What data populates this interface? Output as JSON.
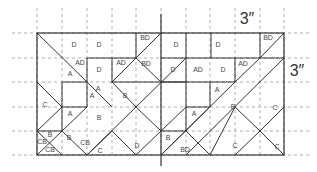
{
  "diagram": {
    "grid_unit_label": "3″",
    "dimension_labels": [
      {
        "text": "3″",
        "x": 247,
        "y": 20
      },
      {
        "text": "3″",
        "x": 297,
        "y": 72
      }
    ],
    "grid": {
      "cols_x": [
        37,
        62,
        87,
        112,
        136,
        161,
        186,
        210,
        235,
        260,
        284
      ],
      "rows_y": [
        33,
        58,
        82,
        107,
        131,
        155
      ],
      "extend_top": 8,
      "extend_left": 12,
      "extend_right": 312
    },
    "outer_rect": {
      "x": 37,
      "y": 33,
      "w": 247,
      "h": 122
    },
    "center_divider": {
      "x": 161,
      "y1": 14,
      "y2": 166
    },
    "lines": [
      [
        37,
        33,
        87,
        82
      ],
      [
        87,
        58,
        87,
        107
      ],
      [
        87,
        58,
        136,
        58
      ],
      [
        136,
        33,
        136,
        58
      ],
      [
        112,
        58,
        112,
        82
      ],
      [
        87,
        82,
        112,
        107
      ],
      [
        112,
        82,
        186,
        82
      ],
      [
        136,
        58,
        111,
        83
      ],
      [
        136,
        58,
        161,
        33
      ],
      [
        186,
        33,
        186,
        58
      ],
      [
        161,
        58,
        284,
        58
      ],
      [
        211,
        33,
        211,
        58
      ],
      [
        260,
        33,
        260,
        58
      ],
      [
        260,
        58,
        284,
        33
      ],
      [
        186,
        58,
        186,
        131
      ],
      [
        235,
        58,
        235,
        82
      ],
      [
        235,
        82,
        260,
        58
      ],
      [
        161,
        82,
        235,
        82
      ],
      [
        210,
        82,
        210,
        107
      ],
      [
        186,
        107,
        210,
        107
      ],
      [
        210,
        107,
        161,
        155
      ],
      [
        235,
        82,
        161,
        155
      ],
      [
        284,
        58,
        186,
        155
      ],
      [
        186,
        131,
        161,
        131
      ],
      [
        186,
        131,
        210,
        155
      ],
      [
        284,
        107,
        260,
        131
      ],
      [
        260,
        131,
        235,
        155
      ],
      [
        235,
        107,
        260,
        131
      ],
      [
        210,
        155,
        235,
        107
      ],
      [
        260,
        131,
        284,
        155
      ],
      [
        37,
        82,
        62,
        107
      ],
      [
        62,
        82,
        62,
        131
      ],
      [
        62,
        107,
        37,
        131
      ],
      [
        62,
        82,
        87,
        82
      ],
      [
        37,
        131,
        62,
        131
      ],
      [
        37,
        131,
        62,
        155
      ],
      [
        37,
        155,
        62,
        131
      ],
      [
        62,
        107,
        87,
        107
      ],
      [
        87,
        107,
        62,
        131
      ],
      [
        62,
        131,
        87,
        155
      ],
      [
        87,
        155,
        136,
        107
      ],
      [
        136,
        107,
        112,
        82
      ],
      [
        87,
        155,
        112,
        131
      ],
      [
        112,
        131,
        136,
        155
      ],
      [
        136,
        155,
        161,
        131
      ],
      [
        136,
        107,
        186,
        58
      ],
      [
        136,
        107,
        161,
        131
      ],
      [
        161,
        131,
        186,
        107
      ],
      [
        161,
        82,
        136,
        58
      ]
    ],
    "pieces": [
      {
        "label": "D",
        "x": 74,
        "y": 45
      },
      {
        "label": "D",
        "x": 99,
        "y": 45
      },
      {
        "label": "BD",
        "x": 145,
        "y": 38
      },
      {
        "label": "AD",
        "x": 80,
        "y": 63
      },
      {
        "label": "A",
        "x": 70,
        "y": 74
      },
      {
        "label": "D",
        "x": 99,
        "y": 70
      },
      {
        "label": "AD",
        "x": 121,
        "y": 63
      },
      {
        "label": "BD",
        "x": 146,
        "y": 64
      },
      {
        "label": "A",
        "x": 98,
        "y": 89
      },
      {
        "label": "A",
        "x": 92,
        "y": 96
      },
      {
        "label": "B",
        "x": 125,
        "y": 96
      },
      {
        "label": "C",
        "x": 45,
        "y": 105
      },
      {
        "label": "A",
        "x": 70,
        "y": 114
      },
      {
        "label": "B",
        "x": 99,
        "y": 118
      },
      {
        "label": "B",
        "x": 50,
        "y": 135
      },
      {
        "label": "CB",
        "x": 42,
        "y": 142
      },
      {
        "label": "CB",
        "x": 50,
        "y": 150
      },
      {
        "label": "B",
        "x": 69,
        "y": 138
      },
      {
        "label": "CB",
        "x": 85,
        "y": 143
      },
      {
        "label": "C",
        "x": 100,
        "y": 151
      },
      {
        "label": "D",
        "x": 137,
        "y": 146
      },
      {
        "label": "D",
        "x": 176,
        "y": 45
      },
      {
        "label": "D",
        "x": 218,
        "y": 45
      },
      {
        "label": "BD",
        "x": 268,
        "y": 38
      },
      {
        "label": "D",
        "x": 173,
        "y": 70
      },
      {
        "label": "AD",
        "x": 198,
        "y": 70
      },
      {
        "label": "D",
        "x": 223,
        "y": 70
      },
      {
        "label": "AD",
        "x": 243,
        "y": 64
      },
      {
        "label": "A",
        "x": 217,
        "y": 90
      },
      {
        "label": "B",
        "x": 233,
        "y": 107
      },
      {
        "label": "C",
        "x": 275,
        "y": 108
      },
      {
        "label": "A",
        "x": 194,
        "y": 114
      },
      {
        "label": "B",
        "x": 168,
        "y": 138
      },
      {
        "label": "BD",
        "x": 185,
        "y": 150
      },
      {
        "label": "C",
        "x": 235,
        "y": 146
      },
      {
        "label": "C",
        "x": 277,
        "y": 147
      }
    ]
  }
}
